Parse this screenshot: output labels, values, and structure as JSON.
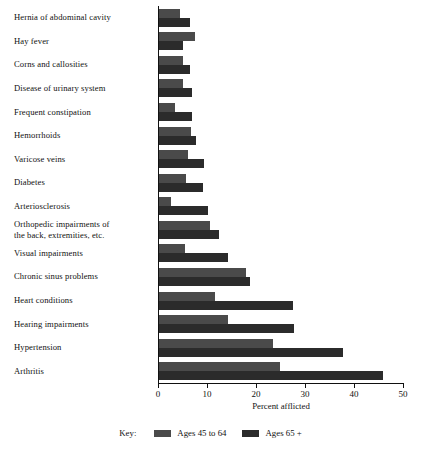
{
  "chart_data": {
    "type": "bar",
    "orientation": "horizontal",
    "title": "",
    "xlabel": "Percent afflicted",
    "ylabel": "",
    "xlim": [
      0,
      50
    ],
    "xticks": [
      0,
      10,
      20,
      30,
      40,
      50
    ],
    "grid": false,
    "legend_position": "bottom",
    "legend_title": "Key:",
    "categories": [
      "Hernia of abdominal cavity",
      "Hay fever",
      "Corns and callosities",
      "Disease of urinary system",
      "Frequent constipation",
      "Hemorrhoids",
      "Varicose veins",
      "Diabetes",
      "Arteriosclerosis",
      "Orthopedic impairments of the back, extremities, etc.",
      "Visual impairments",
      "Chronic sinus problems",
      "Heart conditions",
      "Hearing impairments",
      "Hypertension",
      "Arthritis"
    ],
    "series": [
      {
        "name": "Ages 45 to 64",
        "color": "#4a4a4a",
        "values": [
          4.3,
          7.3,
          4.9,
          4.9,
          3.3,
          6.5,
          5.9,
          5.6,
          2.5,
          10.4,
          5.4,
          17.8,
          11.4,
          14.0,
          23.3,
          24.7
        ]
      },
      {
        "name": "Ages 65 +",
        "color": "#2b2b2b",
        "values": [
          6.3,
          4.9,
          6.3,
          6.7,
          6.7,
          7.5,
          9.2,
          9.0,
          10.0,
          12.2,
          14.0,
          18.6,
          27.3,
          27.6,
          37.6,
          45.7
        ]
      }
    ]
  },
  "axis": {
    "tick_labels": [
      "0",
      "10",
      "20",
      "30",
      "40",
      "50"
    ],
    "title": "Percent afflicted"
  },
  "legend": {
    "key_label": "Key:",
    "items": [
      {
        "label": "Ages 45 to 64",
        "color": "#4a4a4a"
      },
      {
        "label": "Ages 65 +",
        "color": "#2b2b2b"
      }
    ]
  }
}
